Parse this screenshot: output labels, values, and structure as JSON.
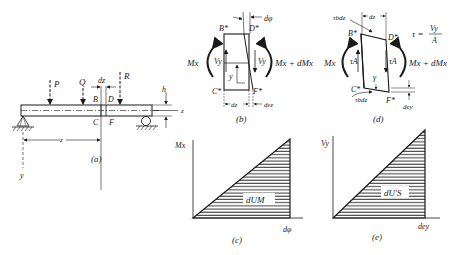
{
  "figure": {
    "panel_a": {
      "caption": "(a)",
      "loads": [
        "P",
        "Q",
        "R"
      ],
      "element_width_label": "dz",
      "element_points": [
        "B",
        "D",
        "C",
        "F"
      ],
      "depth_label": "h",
      "axis_z": "z",
      "axis_y": "y",
      "distance_label": "z"
    },
    "panel_b": {
      "caption": "(b)",
      "corners": [
        "B*",
        "D*",
        "C*",
        "F*"
      ],
      "rotation_label": "dφ",
      "moment_left": "Mx",
      "moment_right": "Mx + dMx",
      "shear_left": "Vy",
      "shear_right": "Vy",
      "fiber_label": "y",
      "width_label": "dz",
      "strain_label": "dεz"
    },
    "panel_c": {
      "caption": "(c)",
      "y_axis": "Mx",
      "x_axis": "dφ",
      "area_label": "dUM"
    },
    "panel_d": {
      "caption": "(d)",
      "corners": [
        "B*",
        "D*",
        "C*",
        "F*"
      ],
      "top_shear": "τbdz",
      "bottom_shear": "τbdz",
      "width_label": "dz",
      "equation_lhs": "τ =",
      "equation_num": "Vy",
      "equation_den": "A",
      "moment_left": "Mx",
      "moment_right": "Mx + dMx",
      "shear_left": "τA",
      "shear_right": "τA",
      "angle_label": "γ",
      "deflection_label": "dey"
    },
    "panel_e": {
      "caption": "(e)",
      "y_axis": "Vy",
      "x_axis": "dey",
      "area_label": "dU'S"
    }
  }
}
